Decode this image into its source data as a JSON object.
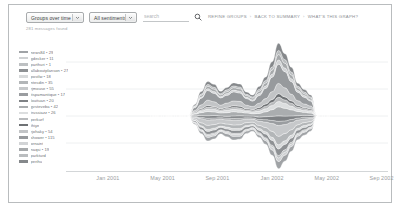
{
  "toolbar": {
    "group_select": {
      "value": "Groups over time",
      "icon": "chevron-down-icon"
    },
    "sentiment_select": {
      "value": "All sentiments",
      "icon": "chevron-down-icon"
    },
    "search": {
      "value": "",
      "placeholder": "search",
      "icon": "search-icon"
    },
    "links": [
      {
        "label": "REFINE GROUPS"
      },
      {
        "label": "BACK TO SUMMARY"
      },
      {
        "label": "WHAT'S THIS GRAPH?"
      }
    ],
    "separator": "›"
  },
  "status": {
    "message_count": "281 messages found"
  },
  "legend": {
    "items": [
      {
        "label": "news84 • 29",
        "color": "#a0a3a6"
      },
      {
        "label": "gdecker • 11",
        "color": "#cfd1d3"
      },
      {
        "label": "parthuri • 1",
        "color": "#bdc0c2"
      },
      {
        "label": "allaboutplanson • 27",
        "color": "#8e9194"
      },
      {
        "label": "postlw • 18",
        "color": "#d8dadb"
      },
      {
        "label": "ntesdin • 35",
        "color": "#b3b6b8"
      },
      {
        "label": "rjmouse • 55",
        "color": "#c6c8ca"
      },
      {
        "label": "itspamantique • 17",
        "color": "#9a9da0"
      },
      {
        "label": "louituan • 20",
        "color": "#7f8285"
      },
      {
        "label": "gvsteveba • 42",
        "color": "#aaadaf"
      },
      {
        "label": "trussiazz • 26",
        "color": "#dcdedf"
      },
      {
        "label": "perkurf",
        "color": "#b8babc"
      },
      {
        "label": "thiye",
        "color": "#6f7275"
      },
      {
        "label": "rjohaky • 54",
        "color": "#c2c4c6"
      },
      {
        "label": "shower • 115",
        "color": "#979a9d"
      },
      {
        "label": "ornaint",
        "color": "#d2d4d6"
      },
      {
        "label": "naqsi • 19",
        "color": "#a6a9ab"
      },
      {
        "label": "parkturd",
        "color": "#babdbf"
      },
      {
        "label": "perihu",
        "color": "#85888b"
      }
    ]
  },
  "chart_data": {
    "type": "area",
    "subtype": "streamgraph",
    "title": "",
    "xlabel": "",
    "ylabel": "",
    "grid": true,
    "legend_position": "left",
    "x_ticks": [
      "Jan 2001",
      "May 2001",
      "Sep 2001",
      "Jan 2002",
      "May 2002",
      "Sep 2002"
    ],
    "x_tick_positions_pct": [
      13,
      30,
      47,
      64,
      81,
      98
    ],
    "x": [
      0,
      1,
      2,
      3,
      4,
      5,
      6,
      7,
      8,
      9,
      10,
      11,
      12,
      13,
      14,
      15,
      16,
      17,
      18,
      19,
      20,
      21,
      22,
      23,
      24,
      25,
      26,
      27,
      28
    ],
    "data_start_pct": 26,
    "data_end_pct": 82,
    "series": [
      {
        "name": "news84 • 29",
        "color": "#a0a3a6",
        "values": [
          0,
          0,
          0,
          0,
          0,
          0,
          0,
          2,
          4,
          6,
          5,
          4,
          5,
          6,
          5,
          4,
          3,
          4,
          6,
          9,
          12,
          10,
          8,
          6,
          5,
          4,
          0,
          0,
          0
        ]
      },
      {
        "name": "gdecker • 11",
        "color": "#cfd1d3",
        "values": [
          0,
          0,
          0,
          0,
          0,
          0,
          0,
          1,
          2,
          3,
          3,
          2,
          2,
          3,
          3,
          2,
          2,
          2,
          3,
          5,
          6,
          5,
          4,
          3,
          2,
          2,
          0,
          0,
          0
        ]
      },
      {
        "name": "parthuri • 1",
        "color": "#bdc0c2",
        "values": [
          0,
          0,
          0,
          0,
          0,
          0,
          0,
          1,
          1,
          2,
          2,
          1,
          2,
          2,
          2,
          1,
          1,
          2,
          2,
          3,
          4,
          4,
          3,
          2,
          2,
          1,
          0,
          0,
          0
        ]
      },
      {
        "name": "allaboutplanson • 27",
        "color": "#8e9194",
        "values": [
          0,
          0,
          0,
          0,
          0,
          0,
          0,
          2,
          4,
          5,
          5,
          4,
          4,
          5,
          5,
          4,
          3,
          4,
          6,
          8,
          11,
          9,
          7,
          5,
          4,
          3,
          0,
          0,
          0
        ]
      },
      {
        "name": "postlw • 18",
        "color": "#d8dadb",
        "values": [
          0,
          0,
          0,
          0,
          0,
          0,
          0,
          1,
          2,
          3,
          3,
          2,
          3,
          3,
          3,
          2,
          2,
          3,
          4,
          5,
          7,
          6,
          5,
          3,
          3,
          2,
          0,
          0,
          0
        ]
      },
      {
        "name": "ntesdin • 35",
        "color": "#b3b6b8",
        "values": [
          0,
          0,
          0,
          0,
          0,
          0,
          0,
          2,
          5,
          7,
          6,
          5,
          5,
          6,
          6,
          5,
          4,
          5,
          7,
          10,
          14,
          12,
          9,
          6,
          5,
          4,
          0,
          0,
          0
        ]
      },
      {
        "name": "rjmouse • 55",
        "color": "#c6c8ca",
        "values": [
          0,
          0,
          0,
          0,
          0,
          0,
          0,
          3,
          7,
          9,
          8,
          7,
          7,
          8,
          8,
          6,
          5,
          7,
          9,
          13,
          18,
          15,
          12,
          8,
          6,
          5,
          0,
          0,
          0
        ]
      },
      {
        "name": "itspamantique • 17",
        "color": "#9a9da0",
        "values": [
          0,
          0,
          0,
          0,
          0,
          0,
          0,
          1,
          2,
          3,
          3,
          2,
          3,
          3,
          3,
          2,
          2,
          3,
          4,
          5,
          7,
          6,
          5,
          3,
          3,
          2,
          0,
          0,
          0
        ]
      },
      {
        "name": "louituan • 20",
        "color": "#7f8285",
        "values": [
          0,
          0,
          0,
          0,
          0,
          0,
          0,
          2,
          3,
          4,
          4,
          3,
          3,
          4,
          4,
          3,
          3,
          4,
          5,
          7,
          9,
          8,
          6,
          4,
          3,
          3,
          0,
          0,
          0
        ]
      },
      {
        "name": "gvsteveba • 42",
        "color": "#aaadaf",
        "values": [
          0,
          0,
          0,
          0,
          0,
          0,
          0,
          2,
          5,
          7,
          6,
          5,
          6,
          7,
          6,
          5,
          4,
          6,
          8,
          11,
          15,
          13,
          10,
          7,
          5,
          4,
          0,
          0,
          0
        ]
      },
      {
        "name": "trussiazz • 26",
        "color": "#dcdedf",
        "values": [
          0,
          0,
          0,
          0,
          0,
          0,
          0,
          1,
          3,
          4,
          4,
          3,
          4,
          4,
          4,
          3,
          3,
          4,
          5,
          7,
          9,
          8,
          6,
          4,
          3,
          3,
          0,
          0,
          0
        ]
      },
      {
        "name": "perkurf",
        "color": "#b8babc",
        "values": [
          0,
          0,
          0,
          0,
          0,
          0,
          0,
          1,
          2,
          3,
          3,
          2,
          3,
          3,
          3,
          2,
          2,
          3,
          4,
          5,
          7,
          6,
          5,
          3,
          3,
          2,
          0,
          0,
          0
        ]
      },
      {
        "name": "thiye",
        "color": "#6f7275",
        "values": [
          0,
          0,
          0,
          0,
          0,
          0,
          0,
          1,
          2,
          3,
          2,
          2,
          2,
          3,
          3,
          2,
          2,
          3,
          4,
          5,
          6,
          5,
          4,
          3,
          2,
          2,
          0,
          0,
          0
        ]
      },
      {
        "name": "rjohaky • 54",
        "color": "#c2c4c6",
        "values": [
          0,
          0,
          0,
          0,
          0,
          0,
          0,
          3,
          6,
          9,
          8,
          6,
          7,
          8,
          8,
          6,
          5,
          7,
          9,
          13,
          17,
          15,
          11,
          8,
          6,
          5,
          0,
          0,
          0
        ]
      },
      {
        "name": "shower • 115",
        "color": "#979a9d",
        "values": [
          0,
          0,
          0,
          0,
          0,
          0,
          0,
          5,
          11,
          16,
          14,
          12,
          13,
          15,
          14,
          11,
          9,
          13,
          17,
          24,
          32,
          27,
          21,
          14,
          11,
          8,
          0,
          0,
          0
        ]
      },
      {
        "name": "ornaint",
        "color": "#d2d4d6",
        "values": [
          0,
          0,
          0,
          0,
          0,
          0,
          0,
          1,
          2,
          3,
          3,
          2,
          3,
          3,
          3,
          2,
          2,
          3,
          4,
          5,
          7,
          6,
          5,
          3,
          3,
          2,
          0,
          0,
          0
        ]
      },
      {
        "name": "naqsi • 19",
        "color": "#a6a9ab",
        "values": [
          0,
          0,
          0,
          0,
          0,
          0,
          0,
          1,
          3,
          4,
          4,
          3,
          3,
          4,
          4,
          3,
          3,
          4,
          5,
          7,
          9,
          8,
          6,
          4,
          3,
          3,
          0,
          0,
          0
        ]
      },
      {
        "name": "parkturd",
        "color": "#babdbf",
        "values": [
          0,
          0,
          0,
          0,
          0,
          0,
          0,
          1,
          2,
          3,
          3,
          2,
          3,
          3,
          3,
          2,
          2,
          3,
          4,
          5,
          7,
          6,
          5,
          3,
          3,
          2,
          0,
          0,
          0
        ]
      },
      {
        "name": "perihu",
        "color": "#85888b",
        "values": [
          0,
          0,
          0,
          0,
          0,
          0,
          0,
          2,
          4,
          5,
          5,
          4,
          4,
          5,
          5,
          4,
          3,
          5,
          6,
          9,
          12,
          10,
          8,
          5,
          4,
          3,
          0,
          0,
          0
        ]
      }
    ]
  }
}
